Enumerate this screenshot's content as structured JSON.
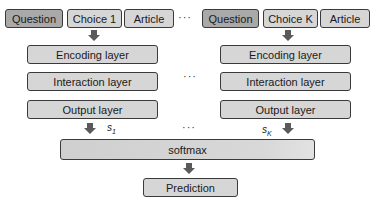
{
  "left_column": {
    "inputs": [
      {
        "label": "Question",
        "style": "dark"
      },
      {
        "label": "Choice 1",
        "style": "light"
      },
      {
        "label": "Article",
        "style": "light"
      }
    ],
    "layers": [
      "Encoding layer",
      "Interaction layer",
      "Output layer"
    ],
    "score": {
      "symbol": "s",
      "subscript": "1"
    }
  },
  "right_column": {
    "inputs": [
      {
        "label": "Question",
        "style": "dark"
      },
      {
        "label": "Choice K",
        "style": "light"
      },
      {
        "label": "Article",
        "style": "light"
      }
    ],
    "layers": [
      "Encoding layer",
      "Interaction layer",
      "Output layer"
    ],
    "score": {
      "symbol": "s",
      "subscript": "K"
    }
  },
  "ellipsis": "···",
  "softmax_label": "softmax",
  "prediction_label": "Prediction",
  "colors": {
    "box_fill": "#d6d6d6",
    "dark_fill": "#a9a9a9",
    "border": "#3a3a3a",
    "arrow": "#5a5a5a"
  }
}
